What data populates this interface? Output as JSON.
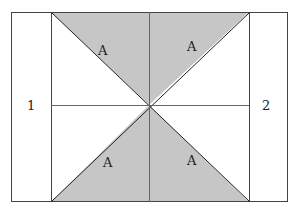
{
  "diagram": {
    "labels": {
      "left_region": "1",
      "right_region": "2",
      "triangle_top_left": "A",
      "triangle_top_right": "A",
      "triangle_bottom_left": "A",
      "triangle_bottom_right": "A"
    },
    "colors": {
      "shaded": "#c6c6c6",
      "stroke": "#333333",
      "background": "#ffffff"
    }
  }
}
